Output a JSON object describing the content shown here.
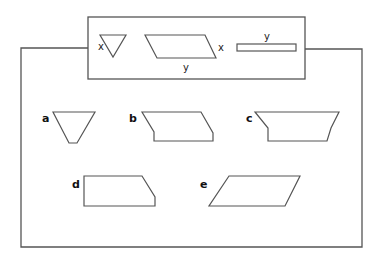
{
  "diagram": {
    "legend_box": {
      "pieces": [
        {
          "shape": "triangle",
          "side_label": "x"
        },
        {
          "shape": "parallelogram",
          "side_labels": [
            "x",
            "y"
          ]
        },
        {
          "shape": "rectangle",
          "top_label": "y"
        }
      ]
    },
    "options": [
      {
        "label": "a",
        "shape": "inverted-trapezoid"
      },
      {
        "label": "b",
        "shape": "notched-quadrilateral"
      },
      {
        "label": "c",
        "shape": "trapezoid-notched"
      },
      {
        "label": "d",
        "shape": "right-trapezoid"
      },
      {
        "label": "e",
        "shape": "parallelogram"
      }
    ],
    "colors": {
      "stroke": "#555555",
      "text": "#222222"
    }
  }
}
